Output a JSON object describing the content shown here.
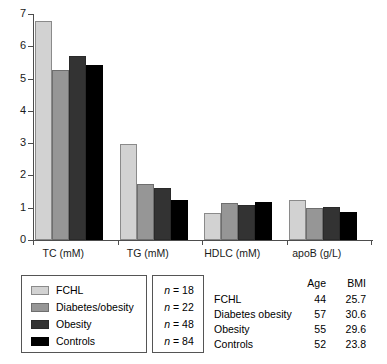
{
  "chart_data": {
    "type": "bar",
    "title": "",
    "xlabel": "",
    "ylabel": "",
    "ylim": [
      0,
      7
    ],
    "yticks": [
      0,
      1,
      2,
      3,
      4,
      5,
      6,
      7
    ],
    "ytick_labels": [
      "0",
      "1",
      "2",
      "3",
      "4",
      "5",
      "6",
      "7"
    ],
    "grid": false,
    "legend_position": "below-left",
    "categories": [
      "TC (mM)",
      "TG (mM)",
      "HDLC (mM)",
      "apoB (g/L)"
    ],
    "series": [
      {
        "name": "FCHL",
        "color": "#d2d2d2",
        "n": 18,
        "values": [
          6.78,
          2.97,
          0.84,
          1.24
        ]
      },
      {
        "name": "Diabetes/obesity",
        "color": "#969696",
        "n": 22,
        "values": [
          5.26,
          1.73,
          1.15,
          0.99
        ]
      },
      {
        "name": "Obesity",
        "color": "#333333",
        "n": 48,
        "values": [
          5.7,
          1.61,
          1.08,
          1.02
        ]
      },
      {
        "name": "Controls",
        "color": "#000000",
        "n": 84,
        "values": [
          5.42,
          1.24,
          1.18,
          0.87
        ]
      }
    ]
  },
  "legend": {
    "entries": [
      {
        "label": "FCHL"
      },
      {
        "label": "Diabetes/obesity"
      },
      {
        "label": "Obesity"
      },
      {
        "label": "Controls"
      }
    ]
  },
  "n_box": {
    "rows": [
      {
        "symbol": "n",
        "eq": "= 18"
      },
      {
        "symbol": "n",
        "eq": "= 22"
      },
      {
        "symbol": "n",
        "eq": "= 48"
      },
      {
        "symbol": "n",
        "eq": "= 84"
      }
    ]
  },
  "stats_table": {
    "headers": [
      "Age",
      "BMI"
    ],
    "rows": [
      {
        "group": "FCHL",
        "age": "44",
        "bmi": "25.7"
      },
      {
        "group": "Diabetes obesity",
        "age": "57",
        "bmi": "30.6"
      },
      {
        "group": "Obesity",
        "age": "55",
        "bmi": "29.6"
      },
      {
        "group": "Controls",
        "age": "52",
        "bmi": "23.8"
      }
    ]
  }
}
